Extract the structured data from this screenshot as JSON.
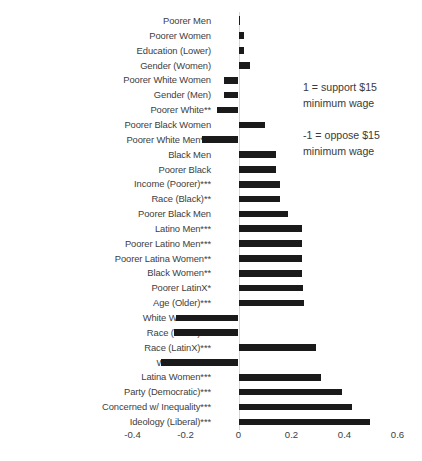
{
  "chart_data": {
    "type": "bar",
    "orientation": "horizontal",
    "title": "",
    "xlabel": "",
    "ylabel": "",
    "xlim": [
      -0.4,
      0.6
    ],
    "xticks": [
      -0.4,
      -0.2,
      0,
      0.2,
      0.4,
      0.6
    ],
    "xtick_labels": [
      "-0.4",
      "-0.2",
      "0",
      "0.2",
      "0.4",
      "0.6"
    ],
    "grid": false,
    "legend": "none",
    "bar_color": "#1a1a1a",
    "categories": [
      "Poorer Men",
      "Poorer Women",
      "Education (Lower)",
      "Gender (Women)",
      "Poorer White Women",
      "Gender (Men)",
      "Poorer White**",
      "Poorer Black Women",
      "Poorer White Men***",
      "Black Men",
      "Poorer Black",
      "Income (Poorer)***",
      "Race (Black)**",
      "Poorer Black Men",
      "Latino Men***",
      "Poorer Latino Men***",
      "Poorer Latina Women**",
      "Black Women**",
      "Poorer LatinX*",
      "Age (Older)***",
      "White Women***",
      "Race (White)***",
      "Race (LatinX)***",
      "White Men***",
      "Latina Women***",
      "Party (Democratic)***",
      "Concerned w/ Inequality***",
      "Ideology (Liberal)***"
    ],
    "values": [
      0.003,
      0.022,
      0.022,
      0.043,
      -0.055,
      -0.055,
      -0.083,
      0.1,
      -0.136,
      0.142,
      0.143,
      0.155,
      0.155,
      0.188,
      0.238,
      0.238,
      0.238,
      0.238,
      0.245,
      0.248,
      -0.234,
      -0.242,
      0.292,
      -0.294,
      0.312,
      0.39,
      0.43,
      0.495
    ]
  },
  "annotations": {
    "support_note": "1 = support $15\nminimum wage",
    "oppose_note": "-1 = oppose $15\nminimum wage"
  }
}
